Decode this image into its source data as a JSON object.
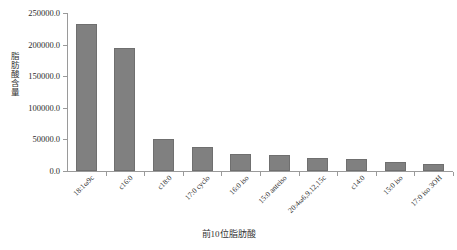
{
  "chart_data": {
    "type": "bar",
    "title": "",
    "xlabel": "前10位脂肪酸",
    "ylabel": "脂肪酸含量",
    "categories": [
      "18:1ω9c",
      "c16:0",
      "c18:0",
      "17:0 cyclo",
      "16:0 iso",
      "15:0 anteiso",
      "20:4ω6,9,12,15c",
      "c14:0",
      "15:0 iso",
      "17:0 iso 3OH"
    ],
    "values": [
      232000,
      195000,
      50000,
      38000,
      27000,
      25000,
      21000,
      19000,
      14000,
      11000
    ],
    "ylim": [
      0,
      250000
    ],
    "ytick_labels": [
      "250000.0",
      "200000.0",
      "150000.0",
      "100000.0",
      "50000.0",
      "0.0"
    ],
    "ytick_values": [
      250000,
      200000,
      150000,
      100000,
      50000,
      0
    ],
    "grid": false,
    "legend": "none",
    "bar_color": "#808080",
    "axis_color": "#9a9a9a"
  }
}
